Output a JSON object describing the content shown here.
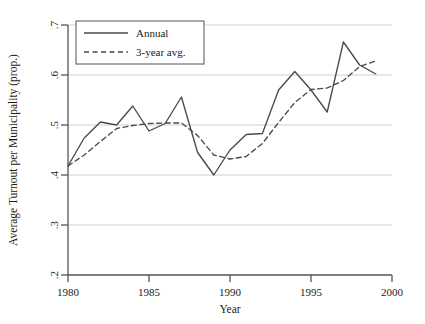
{
  "chart_data": {
    "type": "line",
    "title": "",
    "xlabel": "Year",
    "ylabel": "Average Turnout per Municipality (prop.)",
    "xlim": [
      1980,
      2000
    ],
    "ylim": [
      0.2,
      0.7
    ],
    "xticks": [
      1980,
      1985,
      1990,
      1995,
      2000
    ],
    "xtick_labels": [
      "1980",
      "1985",
      "1990",
      "1995",
      "2000"
    ],
    "yticks": [
      0.2,
      0.3,
      0.4,
      0.5,
      0.6,
      0.7
    ],
    "ytick_labels": [
      ".2",
      ".3",
      ".4",
      ".5",
      ".6",
      ".7"
    ],
    "grid": "horizontal",
    "legend_position": "top-left",
    "x": [
      1980,
      1981,
      1982,
      1983,
      1984,
      1985,
      1986,
      1987,
      1988,
      1989,
      1990,
      1991,
      1992,
      1993,
      1994,
      1995,
      1996,
      1997,
      1998,
      1999
    ],
    "series": [
      {
        "name": "Annual",
        "style": "solid",
        "color": "#4a4a4a",
        "x": [
          1980,
          1981,
          1982,
          1983,
          1984,
          1985,
          1986,
          1987,
          1988,
          1989,
          1990,
          1991,
          1992,
          1993,
          1994,
          1995,
          1996,
          1997,
          1998,
          1999
        ],
        "values": [
          0.418,
          0.474,
          0.506,
          0.5,
          0.538,
          0.488,
          0.503,
          0.556,
          0.445,
          0.4,
          0.45,
          0.481,
          0.483,
          0.57,
          0.607,
          0.57,
          0.526,
          0.666,
          0.62,
          0.602
        ]
      },
      {
        "name": "3-year avg.",
        "style": "dashed",
        "color": "#4a4a4a",
        "x": [
          1980,
          1981,
          1982,
          1983,
          1984,
          1985,
          1986,
          1987,
          1988,
          1989,
          1990,
          1991,
          1992,
          1993,
          1994,
          1995,
          1996,
          1997,
          1998,
          1999
        ],
        "values": [
          0.418,
          0.44,
          0.467,
          0.493,
          0.499,
          0.503,
          0.504,
          0.504,
          0.479,
          0.44,
          0.432,
          0.437,
          0.463,
          0.505,
          0.545,
          0.571,
          0.574,
          0.589,
          0.617,
          0.628
        ]
      }
    ]
  },
  "legend": {
    "items": [
      {
        "label": "Annual",
        "style": "solid"
      },
      {
        "label": "3-year avg.",
        "style": "dashed"
      }
    ]
  }
}
